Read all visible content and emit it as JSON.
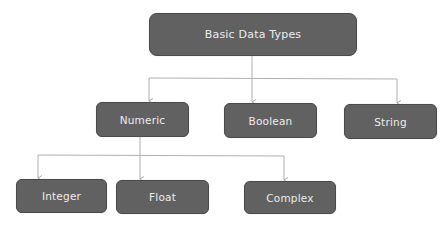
{
  "diagram": {
    "type": "tree",
    "colors": {
      "node_fill": "#616161",
      "node_border": "#4a4a4a",
      "node_text": "#ececec",
      "connector": "#b0b0b0",
      "background": "#ffffff"
    },
    "root": {
      "label": "Basic Data Types"
    },
    "level1": [
      {
        "label": "Numeric"
      },
      {
        "label": "Boolean"
      },
      {
        "label": "String"
      }
    ],
    "level2": [
      {
        "label": "Integer",
        "parent": "Numeric"
      },
      {
        "label": "Float",
        "parent": "Numeric"
      },
      {
        "label": "Complex",
        "parent": "Numeric"
      }
    ]
  }
}
